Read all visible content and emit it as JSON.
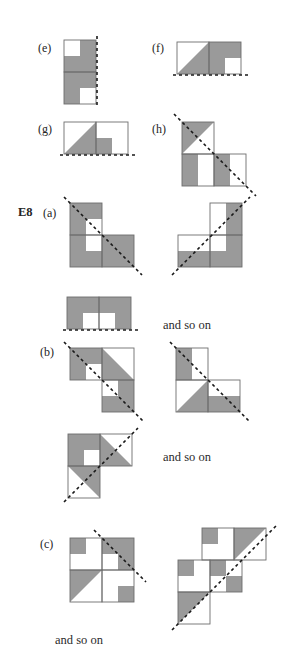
{
  "document": {
    "type": "mathematics-textbook-figure",
    "exercise_label": "E8",
    "colors": {
      "shaded_fill": "#9a9a9a",
      "unshaded_fill": "#ffffff",
      "cell_stroke": "#6e6e6e",
      "outer_stroke": "#6e6e6e",
      "dashed_line": "#1a1a1a",
      "text": "#252525",
      "background": "#ffffff"
    },
    "notes": {
      "dash_pattern": "3,3",
      "dash_width": 1.6,
      "stroke_width": 0.9
    }
  },
  "labels": {
    "e": "(e)",
    "f": "(f)",
    "g": "(g)",
    "h": "(h)",
    "exercise": "E8",
    "a": "(a)",
    "b": "(b)",
    "c": "(c)",
    "and_so_on_1": "and so on",
    "and_so_on_2": "and so on",
    "and_so_on_3": "and so on"
  },
  "figures": [
    {
      "id": "fig-e",
      "label": "(e)",
      "symmetry_line": "vertical-mirror-right-edge",
      "tiles": 2,
      "description": "Two unit squares stacked vertically; each square mostly shaded with one small white quadrant (top square: top-left white; bottom square: bottom-right white). Dashed vertical mirror line on the right edge."
    },
    {
      "id": "fig-f",
      "label": "(f)",
      "symmetry_line": "horizontal-mirror-bottom-edge",
      "tiles": 2,
      "description": "Two unit squares side by side; left square has shaded lower-right triangle, right square fully shaded with white lower-right quadrant. Dashed horizontal mirror line along the bottom edge."
    },
    {
      "id": "fig-g",
      "label": "(g)",
      "symmetry_line": "horizontal-mirror-bottom-edge",
      "tiles": 2,
      "description": "Two unit squares side by side; left square has shaded lower-right triangle, right square has shaded lower-left quadrant. Dashed horizontal mirror line along the bottom edge."
    },
    {
      "id": "fig-h",
      "label": "(h)",
      "symmetry_line": "diagonal-anti-mirror",
      "tiles": 3,
      "description": "L-shaped tromino of three unit squares; upper-left square has shaded upper-left triangle, lower-left square has shaded left half, lower-right square has shaded left half. Dashed anti-diagonal mirror line."
    },
    {
      "id": "fig-a-left",
      "label": "(a)",
      "group": "a",
      "symmetry_line": "diagonal-anti-mirror",
      "tiles": 3,
      "description": "Three-square staircase; shaded cells with white square at centre. Dashed anti-diagonal line from upper-left to lower-right."
    },
    {
      "id": "fig-a-right",
      "label": "(a)",
      "group": "a",
      "symmetry_line": "diagonal-main-mirror",
      "tiles": 3,
      "description": "Mirrored three-square staircase; dashed main-diagonal line from lower-left to upper-right."
    },
    {
      "id": "fig-a-third",
      "label": "(a)",
      "group": "a",
      "symmetry_line": "horizontal-mirror-bottom-edge",
      "tiles": 2,
      "description": "Two unit squares side by side, shaded with white lower middle quadrants. Dashed horizontal mirror line along the bottom edge."
    },
    {
      "id": "fig-b-left",
      "label": "(b)",
      "group": "b",
      "symmetry_line": "diagonal-anti-mirror",
      "tiles": 3,
      "description": "Staircase of three squares with triangular shading and a small white square. Dashed anti-diagonal line."
    },
    {
      "id": "fig-b-right",
      "label": "(b)",
      "group": "b",
      "symmetry_line": "diagonal-anti-mirror",
      "tiles": 3,
      "description": "L-shaped tromino with half-shaded squares and shaded triangle. Dashed anti-diagonal line."
    },
    {
      "id": "fig-b-third",
      "label": "(b)",
      "group": "b",
      "symmetry_line": "diagonal-main-mirror",
      "tiles": 3,
      "description": "Two-square block plus lower square; shaded with white centre square and shaded triangles. Dashed main-diagonal line."
    },
    {
      "id": "fig-c-left",
      "label": "(c)",
      "group": "c",
      "symmetry_line": "diagonal-anti-mirror",
      "tiles": 4,
      "description": "2x2 block of four unit squares, each quartered, with assorted shaded quadrants and a shaded triangle at lower-left. Dashed anti-diagonal line through the top-right region."
    },
    {
      "id": "fig-c-right",
      "label": "(c)",
      "group": "c",
      "symmetry_line": "diagonal-main-mirror",
      "tiles": 5,
      "description": "Staircase of squares with quartered shading and shaded triangles. Dashed main-diagonal line from lower-left to upper-right."
    }
  ]
}
